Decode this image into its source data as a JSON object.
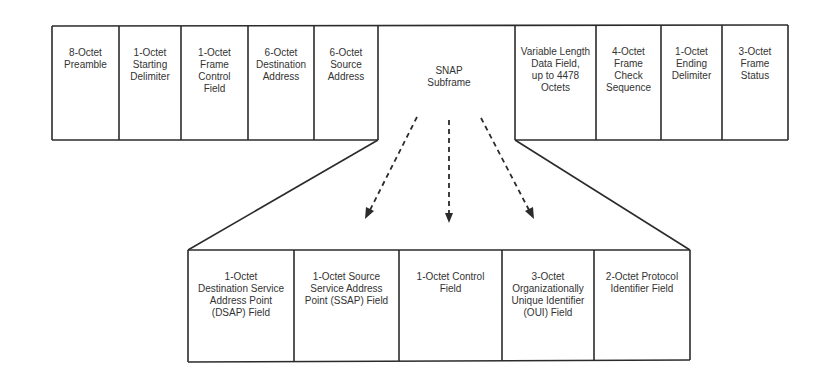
{
  "diagram": {
    "top_frame": {
      "left_fields": [
        {
          "label": "8-Octet\nPreamble",
          "x": 52,
          "w": 67
        },
        {
          "label": "1-Octet\nStarting\nDelimiter",
          "x": 119,
          "w": 62
        },
        {
          "label": "1-Octet\nFrame\nControl\nField",
          "x": 181,
          "w": 67
        },
        {
          "label": "6-Octet\nDestination\nAddress",
          "x": 248,
          "w": 66
        },
        {
          "label": "6-Octet\nSource\nAddress",
          "x": 314,
          "w": 64
        }
      ],
      "snap": {
        "label": "SNAP\nSubframe"
      },
      "right_fields": [
        {
          "label": "Variable Length\nData Field,\nup to 4478\nOctets",
          "x": 515,
          "w": 81
        },
        {
          "label": "4-Octet\nFrame\nCheck\nSequence",
          "x": 596,
          "w": 65
        },
        {
          "label": "1-Octet\nEnding\nDelimiter",
          "x": 661,
          "w": 61
        },
        {
          "label": "3-Octet\nFrame\nStatus",
          "x": 722,
          "w": 66
        }
      ]
    },
    "snap_fields": [
      {
        "label": "1-Octet\nDestination Service\nAddress Point\n(DSAP) Field",
        "x": 188,
        "w": 106
      },
      {
        "label": "1-Octet Source\nService Address\nPoint (SSAP) Field",
        "x": 294,
        "w": 105
      },
      {
        "label": "1-Octet Control\nField",
        "x": 399,
        "w": 103
      },
      {
        "label": "3-Octet\nOrganizationally\nUnique Identifier\n(OUI) Field",
        "x": 502,
        "w": 92
      },
      {
        "label": "2-Octet Protocol\nIdentifier Field",
        "x": 594,
        "w": 96
      }
    ],
    "colors": {
      "line": "#2b2b2b",
      "text": "#333333",
      "background": "#ffffff"
    }
  }
}
